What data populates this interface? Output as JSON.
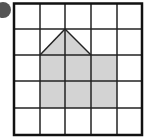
{
  "diagram": {
    "type": "grid-shape",
    "grid": {
      "rows": 5,
      "cols": 5,
      "origin_px": [
        14,
        3
      ],
      "cell_w": 25.6,
      "cell_h": 26.4,
      "line_color": "#222222",
      "border_color": "#111111"
    },
    "shape": {
      "description": "house shape: pentagon composed of a 3x2 rectangle with a triangular roof over the left two columns",
      "fill": "#d3d3d3",
      "rect_cells": {
        "col_start": 1,
        "col_end": 4,
        "row_start": 2,
        "row_end": 4
      },
      "roof": {
        "apex": [
          2,
          1
        ],
        "base_left": [
          1,
          2
        ],
        "base_right": [
          3,
          2
        ]
      }
    },
    "marker": {
      "color": "#555555"
    }
  }
}
